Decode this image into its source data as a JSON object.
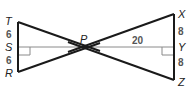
{
  "diagram": {
    "type": "geometry",
    "points": {
      "T": {
        "label": "T"
      },
      "S": {
        "label": "S"
      },
      "R": {
        "label": "R"
      },
      "P": {
        "label": "P"
      },
      "X": {
        "label": "X"
      },
      "Y": {
        "label": "Y"
      },
      "Z": {
        "label": "Z"
      }
    },
    "measures": {
      "TS": "6",
      "SR": "6",
      "PY": "20",
      "XY": "8",
      "YZ": "8"
    },
    "right_angles": [
      "PSR",
      "PYZ"
    ],
    "colors": {
      "thick_line": "#1a1a1a",
      "thin_line": "#8a8a8a"
    }
  }
}
